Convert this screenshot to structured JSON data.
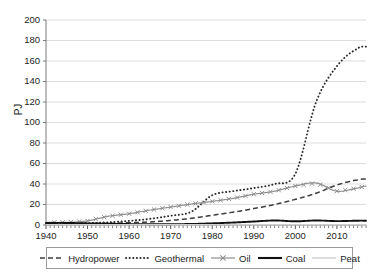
{
  "chart_data": {
    "type": "line",
    "title": "",
    "xlabel": "",
    "ylabel": "PJ",
    "xlim": [
      1940,
      2017
    ],
    "ylim": [
      0,
      200
    ],
    "grid": "horizontal",
    "legend_position": "bottom",
    "x_ticks": [
      "1940",
      "1950",
      "1960",
      "1970",
      "1980",
      "1990",
      "2000",
      "2010"
    ],
    "x_tick_values": [
      1940,
      1950,
      1960,
      1970,
      1980,
      1990,
      2000,
      2010
    ],
    "y_ticks": [
      "0",
      "20",
      "40",
      "60",
      "80",
      "100",
      "120",
      "140",
      "160",
      "180",
      "200"
    ],
    "y_tick_values": [
      0,
      20,
      40,
      60,
      80,
      100,
      120,
      140,
      160,
      180,
      200
    ],
    "x": [
      1940,
      1945,
      1950,
      1955,
      1960,
      1965,
      1970,
      1975,
      1980,
      1985,
      1990,
      1995,
      2000,
      2005,
      2010,
      2015,
      2017
    ],
    "series": [
      {
        "name": "Hydropower",
        "style": "dashed",
        "color": "#3d3d3d",
        "values": [
          0.5,
          0.8,
          1.2,
          1.6,
          2.2,
          3.0,
          4.5,
          6.5,
          9.5,
          12.5,
          16.0,
          20.0,
          25.0,
          31.0,
          39.0,
          44.0,
          45.0
        ]
      },
      {
        "name": "Geothermal",
        "style": "dotted",
        "color": "#2b2b2b",
        "values": [
          1.0,
          1.3,
          1.8,
          2.6,
          4.0,
          6.0,
          9.0,
          13.0,
          29.0,
          33.0,
          36.0,
          40.0,
          50.0,
          120.0,
          155.0,
          172.0,
          174.0
        ]
      },
      {
        "name": "Oil",
        "style": "marker-x",
        "color": "#8f8f8f",
        "values": [
          2.5,
          2.6,
          4.0,
          8.5,
          11.0,
          14.5,
          17.5,
          20.5,
          23.0,
          26.0,
          30.0,
          33.0,
          38.0,
          41.0,
          33.0,
          36.0,
          38.0
        ]
      },
      {
        "name": "Coal",
        "style": "solid-thick",
        "color": "#111111",
        "values": [
          2.0,
          2.0,
          1.6,
          1.2,
          0.9,
          0.8,
          0.8,
          1.0,
          1.6,
          2.4,
          3.4,
          4.4,
          3.6,
          4.4,
          3.8,
          4.2,
          4.2
        ]
      },
      {
        "name": "Peat",
        "style": "solid-light",
        "color": "#cfcfcf",
        "values": [
          0.2,
          0.2,
          0.2,
          0.2,
          0.2,
          0.2,
          0.2,
          0.2,
          0.2,
          0.2,
          0.2,
          0.2,
          0.2,
          0.2,
          0.2,
          0.2,
          0.2
        ]
      }
    ]
  },
  "axis": {
    "y_title": "PJ"
  },
  "legend": {
    "items": [
      {
        "label": "Hydropower"
      },
      {
        "label": "Geothermal"
      },
      {
        "label": "Oil"
      },
      {
        "label": "Coal"
      },
      {
        "label": "Peat"
      }
    ]
  },
  "colors": {
    "grid": "#d4d4d4",
    "axis": "#7a7a7a",
    "text": "#1d1d1d",
    "background": "#ffffff",
    "legend_border": "#9a9a9a"
  }
}
